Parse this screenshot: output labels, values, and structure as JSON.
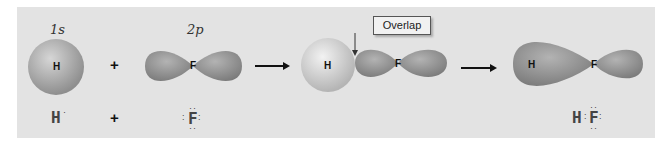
{
  "figure": {
    "orbital_labels": {
      "h_orbital": "1s",
      "f_orbital": "2p"
    },
    "atoms": {
      "hydrogen": "H",
      "fluorine": "F"
    },
    "operators": {
      "plus": "+"
    },
    "callout": {
      "overlap_label": "Overlap"
    },
    "lewis": {
      "hydrogen": "H",
      "hydrogen_dot": "·",
      "fluorine": "F",
      "product": "H:F:",
      "product_h": "H",
      "product_f": "F",
      "colon": ":",
      "top_dots": "··",
      "side_dots": ":"
    },
    "colors": {
      "background": "#e3e3e3",
      "orbital": "#8f8f8f",
      "sphere": "#b5b5b5",
      "text": "#111111"
    }
  }
}
